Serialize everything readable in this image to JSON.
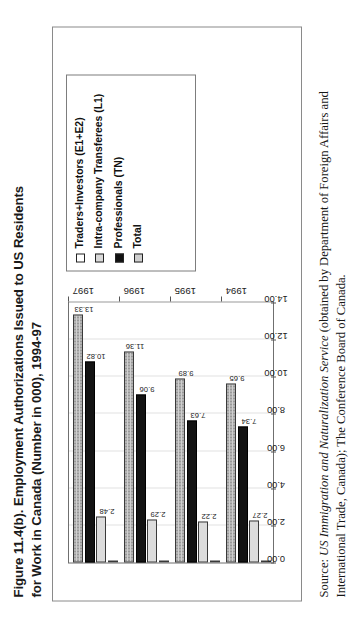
{
  "figure": {
    "title": "Figure 11.4(b). Employment Authorizations Issued to US Residents for Work in Canada (Number in 000), 1994-97",
    "source_prefix": "Source: ",
    "source_italic": "US Immigration and Naturalization Service",
    "source_rest": " (obtained by Department of Foreign Affairs and International Trade, Canada); The Conference Board of Canada."
  },
  "legend": {
    "items": [
      {
        "label": "Traders+Investors (E1+E2)",
        "swatch": "white-square-icon",
        "color": "#ffffff"
      },
      {
        "label": "Intra-company Transferees (L1)",
        "swatch": "light-gray-square-icon",
        "color": "#dcdcdc"
      },
      {
        "label": "Professionals (TN)",
        "swatch": "black-square-icon",
        "color": "#131313"
      },
      {
        "label": "Total",
        "swatch": "dotted-square-icon",
        "color": "#cfcfcf"
      }
    ]
  },
  "chart_data": {
    "type": "bar",
    "orientation": "horizontal",
    "title": "Figure 11.4(b). Employment Authorizations Issued to US Residents for Work in Canada (Number in 000), 1994-97",
    "xlabel": "",
    "ylabel": "",
    "categories": [
      "1994",
      "1995",
      "1996",
      "1997"
    ],
    "axis_ticks": [
      "0.00",
      "2.00",
      "4.00",
      "6.00",
      "8.00",
      "10.00",
      "12.00",
      "14.00"
    ],
    "xlim": [
      0,
      14
    ],
    "grid": true,
    "legend_position": "right",
    "series": [
      {
        "name": "Traders+Investors (E1+E2)",
        "color": "#ffffff",
        "values": [
          0.04,
          0.04,
          0.01,
          0.05
        ],
        "labels": [
          "",
          "",
          "",
          ""
        ]
      },
      {
        "name": "Intra-company Transferees (L1)",
        "color": "#dcdcdc",
        "values": [
          2.27,
          2.22,
          2.29,
          2.48
        ],
        "labels": [
          "2.27",
          "2.22",
          "2.29",
          "2.48"
        ]
      },
      {
        "name": "Professionals (TN)",
        "color": "#131313",
        "values": [
          7.34,
          7.63,
          9.06,
          10.82
        ],
        "labels": [
          "7.34",
          "7.63",
          "9.06",
          "10.82"
        ]
      },
      {
        "name": "Total",
        "color": "#cfcfcf",
        "values": [
          9.65,
          9.89,
          11.36,
          13.33
        ],
        "labels": [
          "9.65",
          "9.89",
          "11.36",
          "13.33"
        ]
      }
    ]
  }
}
